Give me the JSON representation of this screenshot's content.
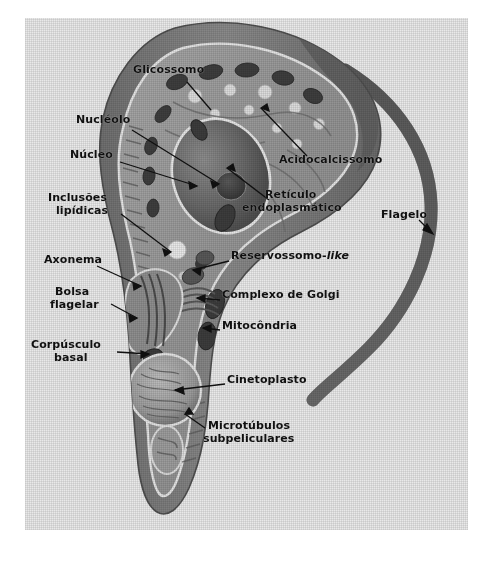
{
  "figure": {
    "organism": "Trypanosoma cruzi epimastigote",
    "background_color": "#e9e9e9",
    "label_color": "#111111",
    "border_color": "#ffffff"
  },
  "labels": [
    {
      "id": "glicossomo",
      "text": "Glicossomo",
      "x": 108,
      "y": 52,
      "align": "left"
    },
    {
      "id": "nucleolo",
      "text": "Nucléolo",
      "x": 51,
      "y": 102,
      "align": "left"
    },
    {
      "id": "nucleo",
      "text": "Núcleo",
      "x": 45,
      "y": 137,
      "align": "left"
    },
    {
      "id": "inclusoes",
      "text": "Inclusões",
      "x": 23,
      "y": 180,
      "align": "left"
    },
    {
      "id": "lipidicas",
      "text": "lipídicas",
      "x": 31,
      "y": 193,
      "align": "left"
    },
    {
      "id": "axonema",
      "text": "Axonema",
      "x": 19,
      "y": 242,
      "align": "left"
    },
    {
      "id": "bolsa",
      "text": "Bolsa",
      "x": 30,
      "y": 274,
      "align": "left"
    },
    {
      "id": "flagelar",
      "text": "flagelar",
      "x": 25,
      "y": 287,
      "align": "left"
    },
    {
      "id": "corpusculo",
      "text": "Corpúsculo",
      "x": 6,
      "y": 327,
      "align": "left"
    },
    {
      "id": "basal",
      "text": "basal",
      "x": 29,
      "y": 340,
      "align": "left"
    },
    {
      "id": "acidocalcissomo",
      "text": "Acidocalcissomo",
      "x": 254,
      "y": 142,
      "align": "left"
    },
    {
      "id": "reticulo",
      "text": "Retículo",
      "x": 240,
      "y": 177,
      "align": "left"
    },
    {
      "id": "endoplasmatico",
      "text": "endoplasmático",
      "x": 217,
      "y": 190,
      "align": "left"
    },
    {
      "id": "flagelo",
      "text": "Flagelo",
      "x": 356,
      "y": 197,
      "align": "left"
    },
    {
      "id": "reservossomo",
      "text": "Reservossomo-",
      "text2": "like",
      "x": 206,
      "y": 238,
      "align": "left"
    },
    {
      "id": "golgi",
      "text": "Complexo de Golgi",
      "x": 197,
      "y": 277,
      "align": "left"
    },
    {
      "id": "mitocondria",
      "text": "Mitocôndria",
      "x": 197,
      "y": 308,
      "align": "left"
    },
    {
      "id": "cinetoplasto",
      "text": "Cinetoplasto",
      "x": 202,
      "y": 362,
      "align": "left"
    },
    {
      "id": "microtubulos",
      "text": "Microtúbulos",
      "x": 183,
      "y": 408,
      "align": "left"
    },
    {
      "id": "subpeliculares",
      "text": "subpeliculares",
      "x": 178,
      "y": 421,
      "align": "left"
    }
  ],
  "structures": [
    {
      "id": "flagellum",
      "name": "Flagelo"
    },
    {
      "id": "cell-body",
      "name": "corpo celular"
    },
    {
      "id": "nucleus",
      "name": "Núcleo"
    },
    {
      "id": "nucleolus",
      "name": "Nucléolo"
    },
    {
      "id": "kinetoplast",
      "name": "Cinetoplasto"
    },
    {
      "id": "flagellar-pocket",
      "name": "Bolsa flagelar"
    },
    {
      "id": "basal-body",
      "name": "Corpúsculo basal"
    },
    {
      "id": "golgi",
      "name": "Complexo de Golgi"
    },
    {
      "id": "mitochondrion",
      "name": "Mitocôndria"
    },
    {
      "id": "glycosome",
      "name": "Glicossomo"
    },
    {
      "id": "acidocalcisome",
      "name": "Acidocalcissomo"
    },
    {
      "id": "er",
      "name": "Retículo endoplasmático"
    },
    {
      "id": "lipid-inclusion",
      "name": "Inclusões lipídicas"
    },
    {
      "id": "reservosome",
      "name": "Reservossomo-like"
    },
    {
      "id": "subpellicular-microtubules",
      "name": "Microtúbulos subpeliculares"
    }
  ]
}
